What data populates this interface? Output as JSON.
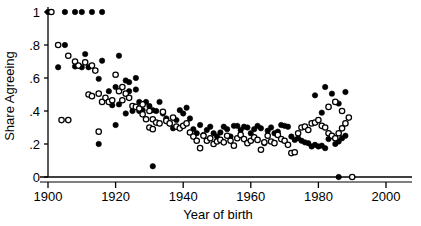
{
  "chart_data": {
    "type": "scatter",
    "title": "",
    "subtitle": "",
    "xlabel": "Year of birth",
    "ylabel": "Share Agreeing",
    "xlim": [
      1897,
      2003
    ],
    "ylim": [
      0,
      1.03
    ],
    "xticks": [
      1900,
      1920,
      1940,
      1960,
      1980,
      2000
    ],
    "xtick_labels": [
      "1900",
      "1920",
      "1940",
      "1960",
      "1980",
      "2000"
    ],
    "yticks": [
      0,
      0.2,
      0.4,
      0.6,
      0.8,
      1
    ],
    "ytick_labels": [
      "0",
      ".2",
      ".4",
      ".6",
      ".8",
      "1"
    ],
    "grid": false,
    "legend": "none",
    "marker_colors": {
      "filled": "#000000",
      "open_stroke": "#000000",
      "open_fill": "#ffffff"
    },
    "series": [
      {
        "name": "filled",
        "marker": "filled-circle",
        "points": [
          [
            1900,
            1.0
          ],
          [
            1905,
            1.0
          ],
          [
            1908,
            1.0
          ],
          [
            1910,
            1.0
          ],
          [
            1913,
            1.0
          ],
          [
            1916,
            1.0
          ],
          [
            1903,
            0.665
          ],
          [
            1905,
            0.8
          ],
          [
            1911,
            0.745
          ],
          [
            1910,
            0.665
          ],
          [
            1912,
            0.665
          ],
          [
            1916,
            0.705
          ],
          [
            1921,
            0.735
          ],
          [
            1915,
            0.595
          ],
          [
            1918,
            0.52
          ],
          [
            1920,
            0.545
          ],
          [
            1923,
            0.585
          ],
          [
            1924,
            0.575
          ],
          [
            1926,
            0.6
          ],
          [
            1919,
            0.435
          ],
          [
            1921,
            0.44
          ],
          [
            1915,
            0.2
          ],
          [
            1920,
            0.315
          ],
          [
            1923,
            0.385
          ],
          [
            1925,
            0.4
          ],
          [
            1927,
            0.4
          ],
          [
            1928,
            0.405
          ],
          [
            1929,
            0.455
          ],
          [
            1930,
            0.43
          ],
          [
            1931,
            0.405
          ],
          [
            1932,
            0.4
          ],
          [
            1933,
            0.455
          ],
          [
            1931,
            0.065
          ],
          [
            1934,
            0.385
          ],
          [
            1935,
            0.355
          ],
          [
            1936,
            0.325
          ],
          [
            1937,
            0.295
          ],
          [
            1938,
            0.345
          ],
          [
            1939,
            0.405
          ],
          [
            1940,
            0.385
          ],
          [
            1941,
            0.42
          ],
          [
            1942,
            0.355
          ],
          [
            1943,
            0.29
          ],
          [
            1944,
            0.265
          ],
          [
            1945,
            0.315
          ],
          [
            1946,
            0.255
          ],
          [
            1947,
            0.285
          ],
          [
            1948,
            0.305
          ],
          [
            1949,
            0.265
          ],
          [
            1950,
            0.245
          ],
          [
            1951,
            0.27
          ],
          [
            1952,
            0.305
          ],
          [
            1953,
            0.29
          ],
          [
            1954,
            0.245
          ],
          [
            1955,
            0.31
          ],
          [
            1956,
            0.31
          ],
          [
            1957,
            0.285
          ],
          [
            1958,
            0.305
          ],
          [
            1959,
            0.3
          ],
          [
            1960,
            0.265
          ],
          [
            1961,
            0.29
          ],
          [
            1962,
            0.31
          ],
          [
            1963,
            0.295
          ],
          [
            1964,
            0.205
          ],
          [
            1965,
            0.28
          ],
          [
            1966,
            0.3
          ],
          [
            1967,
            0.265
          ],
          [
            1968,
            0.275
          ],
          [
            1969,
            0.315
          ],
          [
            1970,
            0.31
          ],
          [
            1971,
            0.305
          ],
          [
            1972,
            0.245
          ],
          [
            1973,
            0.225
          ],
          [
            1974,
            0.235
          ],
          [
            1975,
            0.22
          ],
          [
            1976,
            0.21
          ],
          [
            1977,
            0.205
          ],
          [
            1978,
            0.185
          ],
          [
            1979,
            0.195
          ],
          [
            1980,
            0.185
          ],
          [
            1981,
            0.19
          ],
          [
            1982,
            0.175
          ],
          [
            1979,
            0.495
          ],
          [
            1982,
            0.545
          ],
          [
            1984,
            0.505
          ],
          [
            1986,
            0.445
          ],
          [
            1988,
            0.515
          ],
          [
            1983,
            0.23
          ],
          [
            1984,
            0.25
          ],
          [
            1985,
            0.2
          ],
          [
            1986,
            0.215
          ],
          [
            1987,
            0.235
          ],
          [
            1988,
            0.25
          ],
          [
            1986,
            0.0
          ],
          [
            1981,
            0.39
          ],
          [
            1924,
            0.52
          ],
          [
            1926,
            0.53
          ],
          [
            1908,
            0.67
          ],
          [
            1927,
            0.455
          ]
        ]
      },
      {
        "name": "open",
        "marker": "open-circle",
        "points": [
          [
            1901,
            1.0
          ],
          [
            1903,
            0.8
          ],
          [
            1906,
            0.735
          ],
          [
            1908,
            0.7
          ],
          [
            1909,
            0.675
          ],
          [
            1911,
            0.695
          ],
          [
            1913,
            0.675
          ],
          [
            1914,
            0.645
          ],
          [
            1904,
            0.345
          ],
          [
            1906,
            0.345
          ],
          [
            1912,
            0.5
          ],
          [
            1913,
            0.49
          ],
          [
            1915,
            0.505
          ],
          [
            1916,
            0.455
          ],
          [
            1917,
            0.48
          ],
          [
            1915,
            0.275
          ],
          [
            1918,
            0.455
          ],
          [
            1919,
            0.465
          ],
          [
            1920,
            0.62
          ],
          [
            1921,
            0.52
          ],
          [
            1922,
            0.545
          ],
          [
            1923,
            0.505
          ],
          [
            1924,
            0.48
          ],
          [
            1925,
            0.43
          ],
          [
            1926,
            0.425
          ],
          [
            1927,
            0.415
          ],
          [
            1928,
            0.38
          ],
          [
            1929,
            0.35
          ],
          [
            1930,
            0.4
          ],
          [
            1931,
            0.35
          ],
          [
            1932,
            0.33
          ],
          [
            1933,
            0.325
          ],
          [
            1934,
            0.395
          ],
          [
            1935,
            0.34
          ],
          [
            1936,
            0.325
          ],
          [
            1937,
            0.36
          ],
          [
            1938,
            0.305
          ],
          [
            1939,
            0.295
          ],
          [
            1940,
            0.31
          ],
          [
            1941,
            0.325
          ],
          [
            1942,
            0.27
          ],
          [
            1943,
            0.245
          ],
          [
            1944,
            0.22
          ],
          [
            1945,
            0.175
          ],
          [
            1946,
            0.25
          ],
          [
            1947,
            0.22
          ],
          [
            1948,
            0.235
          ],
          [
            1949,
            0.2
          ],
          [
            1950,
            0.215
          ],
          [
            1951,
            0.225
          ],
          [
            1952,
            0.21
          ],
          [
            1953,
            0.25
          ],
          [
            1954,
            0.22
          ],
          [
            1955,
            0.19
          ],
          [
            1956,
            0.235
          ],
          [
            1957,
            0.255
          ],
          [
            1958,
            0.23
          ],
          [
            1959,
            0.205
          ],
          [
            1960,
            0.22
          ],
          [
            1961,
            0.24
          ],
          [
            1962,
            0.225
          ],
          [
            1963,
            0.165
          ],
          [
            1964,
            0.21
          ],
          [
            1965,
            0.25
          ],
          [
            1966,
            0.215
          ],
          [
            1967,
            0.205
          ],
          [
            1968,
            0.255
          ],
          [
            1969,
            0.23
          ],
          [
            1970,
            0.22
          ],
          [
            1971,
            0.195
          ],
          [
            1972,
            0.145
          ],
          [
            1973,
            0.15
          ],
          [
            1974,
            0.265
          ],
          [
            1975,
            0.3
          ],
          [
            1976,
            0.305
          ],
          [
            1977,
            0.285
          ],
          [
            1978,
            0.325
          ],
          [
            1979,
            0.33
          ],
          [
            1980,
            0.345
          ],
          [
            1981,
            0.31
          ],
          [
            1982,
            0.3
          ],
          [
            1983,
            0.265
          ],
          [
            1984,
            0.25
          ],
          [
            1985,
            0.235
          ],
          [
            1986,
            0.265
          ],
          [
            1987,
            0.295
          ],
          [
            1988,
            0.325
          ],
          [
            1989,
            0.36
          ],
          [
            1983,
            0.425
          ],
          [
            1985,
            0.455
          ],
          [
            1987,
            0.4
          ],
          [
            1990,
            0.0
          ],
          [
            1922,
            0.465
          ],
          [
            1928,
            0.44
          ],
          [
            1930,
            0.3
          ],
          [
            1931,
            0.29
          ]
        ]
      }
    ]
  },
  "axes": {
    "y_title": "Share Agreeing",
    "x_title": "Year of birth"
  }
}
